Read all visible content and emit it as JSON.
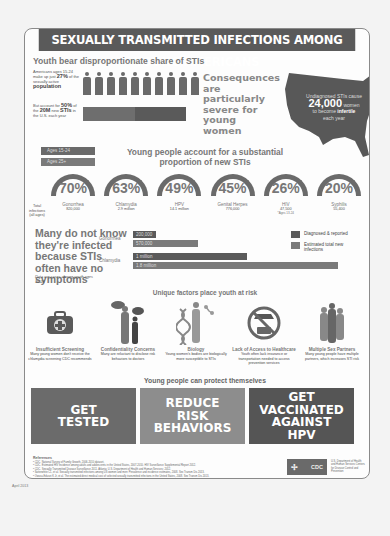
{
  "header": {
    "title": "SEXUALLY TRANSMITTED INFECTIONS AMONG YOUNG AMERICANS"
  },
  "share": {
    "title": "Youth bear disproportionate share of STIs",
    "pop_text_pre": "Americans ages 15-24 make up just",
    "pop_pct": "27%",
    "pop_text_mid": "of the sexually active",
    "pop_word": "population",
    "sti_text_pre": "But account for",
    "sti_pct": "50%",
    "sti_text_mid": "of the",
    "sti_total": "20M",
    "sti_text_new": "new",
    "sti_word": "STIs",
    "sti_text_post": "in the U.S. each year",
    "people_count": 10
  },
  "consequences": {
    "text": "Consequences are particularly severe for young women"
  },
  "map": {
    "line1": "Undiagnosed STIs cause",
    "number": "24,000",
    "line2": "women",
    "line3": "to become",
    "bold": "infertile",
    "line4": "each year"
  },
  "age_legend": [
    {
      "label": "Ages 15-24"
    },
    {
      "label": "Ages 25+"
    }
  ],
  "proportion": {
    "title": "Young people account for a substantial proportion of new STIs",
    "total_label": "Total infections (all ages)",
    "items": [
      {
        "pct": "70%",
        "name": "Gonorrhea",
        "total": "820,000",
        "note": ""
      },
      {
        "pct": "63%",
        "name": "Chlamydia",
        "total": "2.9 million",
        "note": ""
      },
      {
        "pct": "49%",
        "name": "HPV",
        "total": "14.1 million",
        "note": ""
      },
      {
        "pct": "45%",
        "name": "Genital Herpes",
        "total": "776,000",
        "note": ""
      },
      {
        "pct": "26%",
        "name": "HIV",
        "total": "47,500",
        "note": "*Ages 13-24"
      },
      {
        "pct": "20%",
        "name": "Syphilis",
        "total": "55,400",
        "note": ""
      }
    ]
  },
  "unaware": {
    "title": "Many do not know they're infected because STIs often have no symptoms",
    "note": "Data are cases among youth ages 15-24",
    "groups": [
      {
        "name": "Gonorrhea",
        "diagnosed": "200,000",
        "estimated": "570,000",
        "diagnosed_value": 200000,
        "estimated_value": 570000
      },
      {
        "name": "Chlamydia",
        "diagnosed": "1 million",
        "estimated": "1.8 million",
        "diagnosed_value": 1000000,
        "estimated_value": 1800000
      }
    ],
    "legend": {
      "diagnosed": "Diagnosed & reported",
      "estimated": "Estimated total new infections"
    }
  },
  "factors": {
    "title": "Unique factors place youth at risk",
    "items": [
      {
        "name": "Insufficient Screening",
        "desc": "Many young women don't receive the chlamydia screening CDC recommends",
        "icon": "medical-kit-icon"
      },
      {
        "name": "Confidentiality Concerns",
        "desc": "Many are reluctant to disclose risk behaviors to doctors",
        "icon": "speech-people-icon"
      },
      {
        "name": "Biology",
        "desc": "Young women's bodies are biologically more susceptible to STIs",
        "icon": "dna-body-icon"
      },
      {
        "name": "Lack of Access to Healthcare",
        "desc": "Youth often lack insurance or transportation needed to access prevention services",
        "icon": "no-car-icon"
      },
      {
        "name": "Multiple Sex Partners",
        "desc": "Many young people have multiple partners, which increases STI risk",
        "icon": "crowd-icon"
      }
    ]
  },
  "protect": {
    "title": "Young people can protect themselves",
    "actions": [
      {
        "label": "GET TESTED",
        "color": "#6b6b6b"
      },
      {
        "label": "REDUCE RISK BEHAVIORS",
        "color": "#8d8d8d"
      },
      {
        "label": "GET VACCINATED AGAINST HPV",
        "color": "#555555"
      }
    ]
  },
  "references": {
    "title": "References",
    "lines": [
      "• CDC. National Survey of Family Growth, 2006-2010 dataset.",
      "• CDC. Estimated HIV incidence among adults and adolescents in the United States, 2007-2010. HIV Surveillance Supplemental Report 2012.",
      "• CDC. Sexually Transmitted Disease Surveillance 2011. Atlanta: U.S. Department of Health and Human Services; 2012.",
      "• Satterwhite CL, et al. Sexually transmitted infections among US women and men: Prevalence and incidence estimates, 2008. Sex Transm Dis 2013.",
      "• Owusu-Edusei K Jr, et al. The estimated direct medical cost of selected sexually transmitted infections in the United States, 2008. Sex Transm Dis 2013."
    ]
  },
  "cdc": {
    "logo": "CDC",
    "agency": "U.S. Department of Health and Human Services Centers for Disease Control and Prevention"
  },
  "date": "April 2013"
}
